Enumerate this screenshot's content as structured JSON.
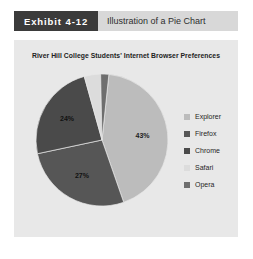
{
  "exhibit": {
    "tag": "Exhibit 4-12",
    "caption": "Illustration of a Pie Chart"
  },
  "chart_data": {
    "type": "pie",
    "title": "River Hill College Students' Internet Browser Preferences",
    "xlabel": "",
    "ylabel": "",
    "legend_position": "right",
    "grid": false,
    "categories": [
      "Explorer",
      "Firefox",
      "Chrome",
      "Safari",
      "Opera"
    ],
    "values": [
      43,
      27,
      24,
      4,
      2
    ],
    "value_labels": [
      "43%",
      "27%",
      "24%",
      "4%",
      "2%"
    ],
    "colors": [
      "#bcbcbc",
      "#565656",
      "#4a4a4a",
      "#dcdcdc",
      "#6e6e6e"
    ],
    "units": "percent",
    "total": 100
  },
  "legend": {
    "items": [
      {
        "label": "Explorer",
        "color": "#bcbcbc"
      },
      {
        "label": "Firefox",
        "color": "#565656"
      },
      {
        "label": "Chrome",
        "color": "#4a4a4a"
      },
      {
        "label": "Safari",
        "color": "#dcdcdc"
      },
      {
        "label": "Opera",
        "color": "#6e6e6e"
      }
    ]
  }
}
